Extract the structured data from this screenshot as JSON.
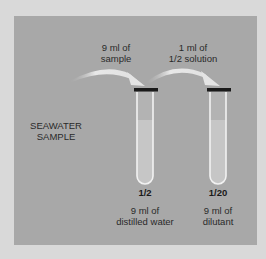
{
  "diagram": {
    "source_label": [
      "SEAWATER",
      "SAMPLE"
    ],
    "transfers": [
      {
        "label": [
          "9 ml of",
          "sample"
        ]
      },
      {
        "label": [
          "1 ml of",
          "1/2 solution"
        ]
      }
    ],
    "tubes": [
      {
        "dilution": "1/2",
        "contents": [
          "9 ml of",
          "distilled water"
        ]
      },
      {
        "dilution": "1/20",
        "contents": [
          "9 ml of",
          "dilutant"
        ]
      }
    ],
    "colors": {
      "background": "#d9d9d9",
      "panel": "#a8a8a8",
      "tube_outline": "#f2f2f2",
      "liquid": "#c4c4c4",
      "cap": "#1a1a1a",
      "arrow": "#e6e6e6"
    }
  }
}
